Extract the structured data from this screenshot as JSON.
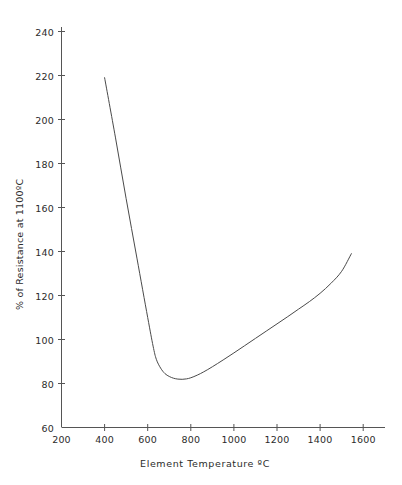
{
  "chart_data": {
    "type": "line",
    "title": "",
    "xlabel": "Element Temperature ºC",
    "ylabel": "% of Resistance at 1100ºC",
    "xlim": [
      200,
      1700
    ],
    "ylim": [
      60,
      250
    ],
    "grid": false,
    "legend": "none",
    "xticks": [
      200,
      400,
      600,
      800,
      1000,
      1200,
      1400,
      1600
    ],
    "xtick_labels": [
      "200",
      "400",
      "600",
      "800",
      "1000",
      "1200",
      "1400",
      "1600"
    ],
    "yticks": [
      60,
      80,
      100,
      120,
      140,
      160,
      180,
      200,
      220,
      240
    ],
    "ytick_labels": [
      "60",
      "80",
      "100",
      "120",
      "140",
      "160",
      "180",
      "200",
      "220",
      "240"
    ],
    "series": [
      {
        "name": "Resistance vs Element Temperature",
        "color": "#4a4a4a",
        "x": [
          400,
          450,
          500,
          550,
          600,
          625,
          640,
          660,
          680,
          700,
          720,
          740,
          760,
          780,
          800,
          830,
          860,
          900,
          950,
          1000,
          1050,
          1100,
          1150,
          1200,
          1250,
          1300,
          1350,
          1400,
          1450,
          1500,
          1545
        ],
        "y": [
          219,
          192,
          164,
          137,
          110,
          97,
          91,
          87,
          84.5,
          83.2,
          82.4,
          82.0,
          81.9,
          82.1,
          82.6,
          83.8,
          85.3,
          87.6,
          90.7,
          93.9,
          97.2,
          100.5,
          103.8,
          107.1,
          110.4,
          113.8,
          117.2,
          121.0,
          125.5,
          131.0,
          139.0
        ]
      }
    ]
  },
  "axis": {
    "x_title": "Element Temperature ºC",
    "y_title": "% of Resistance at 1100ºC"
  },
  "colors": {
    "line": "#4a4a4a",
    "axis": "#555555",
    "text": "#2b2b2b",
    "background": "#ffffff"
  }
}
